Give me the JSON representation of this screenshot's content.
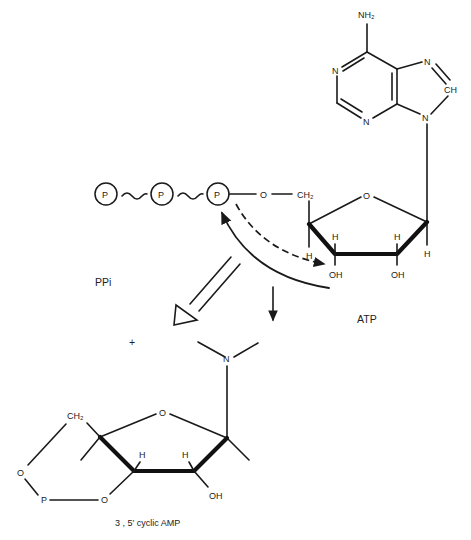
{
  "diagram": {
    "atp": {
      "label": "ATP",
      "adenine": {
        "nh2": "NH₂",
        "n1": "N",
        "n3": "N",
        "n7": "N",
        "c8": "CH",
        "n9": "N"
      },
      "phosphates": [
        "P",
        "P",
        "P"
      ],
      "bridge_o": "O",
      "ch2": "CH₂",
      "ring_o": "O",
      "h_labels": [
        "H",
        "H",
        "H",
        "H"
      ],
      "oh_labels": [
        "OH",
        "OH"
      ]
    },
    "ppi": {
      "label": "PPi"
    },
    "plus": {
      "label": "+"
    },
    "camp": {
      "label": "3 , 5′ cyclic AMP",
      "n": "N",
      "ring_o": "O",
      "ch2": "CH₂",
      "ester_o1": "O",
      "ester_o2": "O",
      "p": "P",
      "h_labels": [
        "H",
        "H"
      ],
      "oh": "OH"
    },
    "arrows": {
      "attack_arrow": "dashed arrow from 3'-OH to alpha phosphate",
      "curved_arrow": "solid curved arrow to alpha phosphate",
      "product_arrow": "straight down arrow",
      "release_arrow": "open double arrow toward PPi"
    }
  }
}
